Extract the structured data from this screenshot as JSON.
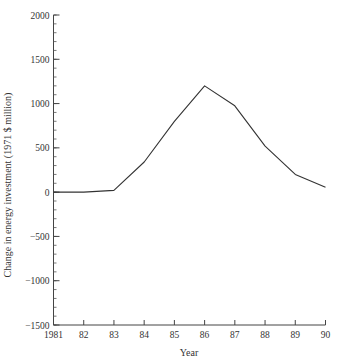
{
  "chart_data": {
    "type": "line",
    "title": "",
    "xlabel": "Year",
    "ylabel": "Change in energy investment (1971 $ million)",
    "x": [
      "1981",
      "82",
      "83",
      "84",
      "85",
      "86",
      "87",
      "88",
      "89",
      "90"
    ],
    "series": [
      {
        "name": "Change in energy investment",
        "values": [
          0,
          0,
          20,
          340,
          800,
          1200,
          975,
          520,
          200,
          55
        ]
      }
    ],
    "ylim": [
      -1500,
      2000
    ],
    "yticks": [
      2000,
      1500,
      1000,
      500,
      0,
      -500,
      -1000,
      -1500
    ],
    "ytick_labels": [
      "2000",
      "1500",
      "1000",
      "500",
      "0",
      "−500",
      "−1000",
      "−1500"
    ],
    "y_minor_step": 100,
    "grid": false,
    "legend": "none",
    "line_color": "#333333"
  }
}
